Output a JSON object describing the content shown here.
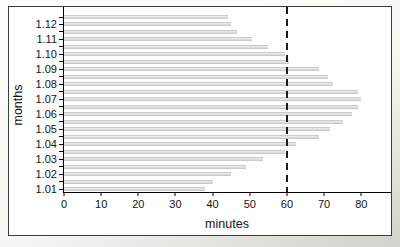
{
  "chart_data": {
    "type": "bar",
    "orientation": "horizontal",
    "title": "",
    "xlabel": "minutes",
    "ylabel": "months",
    "xlim": [
      0,
      88
    ],
    "xticks": [
      0,
      10,
      20,
      30,
      40,
      50,
      60,
      70,
      80
    ],
    "reference_line_x": 60,
    "grid": false,
    "legend": "none",
    "bar_color": "#d9d9d9",
    "axis_color": "#000000",
    "categories": [
      "1.12",
      "1.11",
      "1.10",
      "1.09",
      "1.08",
      "1.07",
      "1.06",
      "1.05",
      "1.04",
      "1.03",
      "1.02",
      "1.01"
    ],
    "rows": [
      {
        "label": "",
        "value": 44
      },
      {
        "label": "1.12",
        "value": 45
      },
      {
        "label": "",
        "value": 46.5
      },
      {
        "label": "1.11",
        "value": 50.5
      },
      {
        "label": "",
        "value": 55
      },
      {
        "label": "1.10",
        "value": 59.5
      },
      {
        "label": "",
        "value": 60.5
      },
      {
        "label": "1.09",
        "value": 68.5
      },
      {
        "label": "",
        "value": 71
      },
      {
        "label": "1.08",
        "value": 72.5
      },
      {
        "label": "",
        "value": 79
      },
      {
        "label": "1.07",
        "value": 80
      },
      {
        "label": "",
        "value": 79
      },
      {
        "label": "1.06",
        "value": 77.5
      },
      {
        "label": "",
        "value": 75
      },
      {
        "label": "1.05",
        "value": 71.5
      },
      {
        "label": "",
        "value": 68.5
      },
      {
        "label": "1.04",
        "value": 62.5
      },
      {
        "label": "",
        "value": 59.5
      },
      {
        "label": "1.03",
        "value": 53.5
      },
      {
        "label": "",
        "value": 49
      },
      {
        "label": "1.02",
        "value": 45
      },
      {
        "label": "",
        "value": 40
      },
      {
        "label": "1.01",
        "value": 38
      }
    ]
  }
}
